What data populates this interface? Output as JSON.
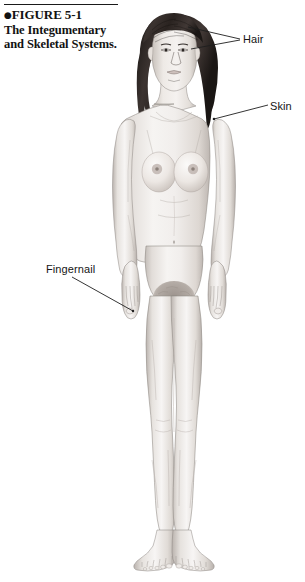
{
  "figure": {
    "caption": {
      "bullet": "●",
      "line1": "FIGURE 5-1",
      "line2": "The Integumentary",
      "line3": "and Skeletal Systems."
    },
    "labels": [
      {
        "id": "hair",
        "text": "Hair"
      },
      {
        "id": "skin",
        "text": "Skin"
      },
      {
        "id": "fingernail",
        "text": "Fingernail"
      }
    ],
    "illustration": {
      "subject": "anterior view of an adult female human body",
      "description": "full-body anatomical drawing, front view, standing, arms at sides",
      "icon_name": "human-body-anterior-illustration"
    },
    "colors": {
      "text": "#151515",
      "caption_text": "#121212",
      "rule": "#1a1a1a",
      "leader_line": "#1e1e1e",
      "page_background": "#ffffff",
      "skin_light": "#f3f0ee",
      "skin_mid": "#ddd8d4",
      "skin_shadow": "#b9b2ad",
      "hair_dark": "#2b2522",
      "outline": "#6e6a67"
    }
  }
}
